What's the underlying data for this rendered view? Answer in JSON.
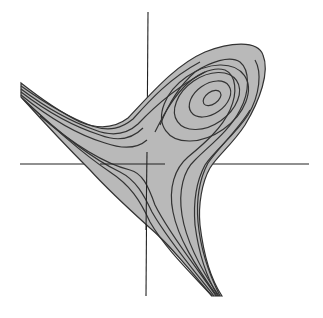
{
  "figure": {
    "description": "Contour plot of a scalar field with a saddle point near the origin and a local extremum in the upper right, drawn over crosshair axes",
    "colors": {
      "background": "#ffffff",
      "fill": "#b9b9b9",
      "contour": "#333333",
      "axis": "#222222"
    },
    "axes": {
      "horizontal": {
        "x1": 20,
        "y1": 164,
        "x2": 309,
        "y2": 164
      },
      "vertical": {
        "x1": 148,
        "y1": 12,
        "x2": 146,
        "y2": 296
      }
    },
    "extremum_center": {
      "x": 212,
      "y": 98
    },
    "contour_count": 9
  }
}
